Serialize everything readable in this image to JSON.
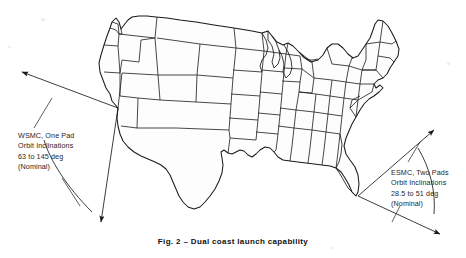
{
  "figure": {
    "caption": "Fig. 2 – Dual coast launch capability",
    "kind": "map-figure",
    "line_color": "#1a1a1a",
    "land_fill": "#fdfdfd",
    "background": "#ffffff"
  },
  "annotations": {
    "west": {
      "name": "wsmc-annotation",
      "lines": [
        "WSMC, One Pad",
        "Orbit Inclinations",
        "63 to 145 deg",
        "(Nominal)"
      ],
      "site_label": "WSMC",
      "pads": "One Pad",
      "inclination_low_deg": 63,
      "inclination_high_deg": 145,
      "qualifier": "(Nominal)"
    },
    "east": {
      "name": "esmc-annotation",
      "lines": [
        "ESMC, Two Pads",
        "Orbit Inclinations",
        "28.5 to 51 deg",
        "(Nominal)"
      ],
      "site_label": "ESMC",
      "pads": "Two Pads",
      "inclination_low_deg": 28.5,
      "inclination_high_deg": 51,
      "qualifier": "(Nominal)"
    }
  },
  "wedges": {
    "west": {
      "name": "wsmc-launch-wedge",
      "apex": [
        118,
        108
      ],
      "upper_arrow_tip": [
        20,
        71
      ],
      "lower_arrow_tip": [
        100,
        224
      ]
    },
    "east": {
      "name": "esmc-launch-wedge",
      "apex": [
        358,
        196
      ],
      "upper_arrow_tip": [
        436,
        128
      ],
      "lower_arrow_tip": [
        437,
        231
      ]
    }
  }
}
